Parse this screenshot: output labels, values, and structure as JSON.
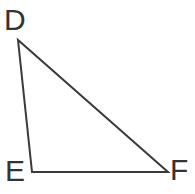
{
  "figure": {
    "kind": "geometry-diagram",
    "shape": "triangle",
    "name": "Triangle DEF",
    "background_color": "#ffffff",
    "stroke_color": "#3a3a3a",
    "stroke_width": 2,
    "label_color": "#333333",
    "label_font_size": 30,
    "canvas": {
      "width": 195,
      "height": 194
    }
  },
  "vertices": [
    {
      "id": "D",
      "label": "D",
      "x": 18,
      "y": 40,
      "label_x": 4,
      "label_y": 5,
      "position": "top-left"
    },
    {
      "id": "E",
      "label": "E",
      "x": 32,
      "y": 172,
      "label_x": 5,
      "label_y": 156,
      "position": "bottom-left"
    },
    {
      "id": "F",
      "label": "F",
      "x": 168,
      "y": 172,
      "label_x": 170,
      "label_y": 155,
      "position": "bottom-right"
    }
  ],
  "edges": [
    {
      "id": "DE",
      "from": "D",
      "to": "E",
      "name": "side-de"
    },
    {
      "id": "EF",
      "from": "E",
      "to": "F",
      "name": "side-ef"
    },
    {
      "id": "FD",
      "from": "F",
      "to": "D",
      "name": "side-fd"
    }
  ],
  "polygon_points": "18,40 32,172 168,172"
}
